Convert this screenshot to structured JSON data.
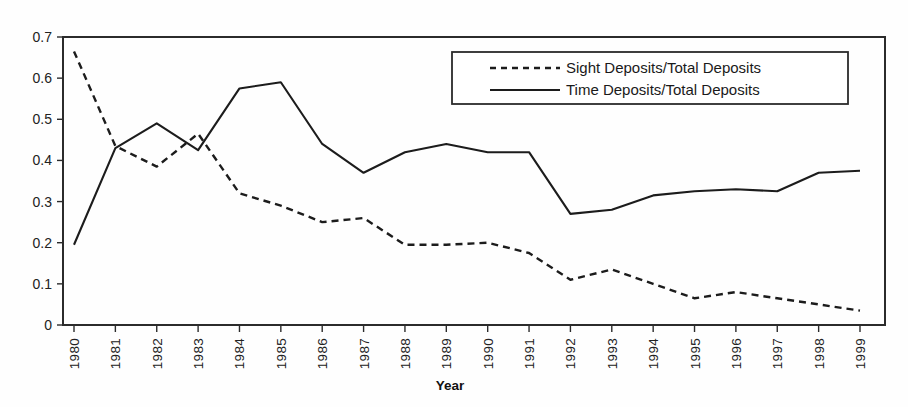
{
  "chart_data": {
    "type": "line",
    "title": "",
    "xlabel": "Year",
    "ylabel": "",
    "categories": [
      "1980",
      "1981",
      "1982",
      "1983",
      "1984",
      "1985",
      "1986",
      "1987",
      "1988",
      "1989",
      "1990",
      "1991",
      "1992",
      "1993",
      "1994",
      "1995",
      "1996",
      "1997",
      "1998",
      "1999"
    ],
    "series": [
      {
        "name": "Sight Deposits/Total Deposits",
        "style": "dashed",
        "values": [
          0.665,
          0.435,
          0.385,
          0.465,
          0.32,
          0.29,
          0.25,
          0.26,
          0.195,
          0.195,
          0.2,
          0.175,
          0.11,
          0.135,
          0.1,
          0.065,
          0.08,
          0.065,
          0.05,
          0.035
        ]
      },
      {
        "name": "Time Deposits/Total Deposits",
        "style": "solid",
        "values": [
          0.195,
          0.43,
          0.49,
          0.425,
          0.575,
          0.59,
          0.44,
          0.37,
          0.42,
          0.44,
          0.42,
          0.42,
          0.27,
          0.28,
          0.315,
          0.325,
          0.33,
          0.325,
          0.37,
          0.375
        ]
      }
    ],
    "ylim": [
      0,
      0.7
    ],
    "yticks": [
      0,
      0.1,
      0.2,
      0.3,
      0.4,
      0.5,
      0.6,
      0.7
    ],
    "ytick_labels": [
      "0",
      "0.1",
      "0.2",
      "0.3",
      "0.4",
      "0.5",
      "0.6",
      "0.7"
    ],
    "grid": false,
    "legend_position": "top-right",
    "line_color": "#1c1c1c",
    "frame_color": "#2b2b2b"
  },
  "legend": {
    "entries": [
      {
        "label": "Sight Deposits/Total Deposits",
        "style": "dashed"
      },
      {
        "label": "Time Deposits/Total Deposits",
        "style": "solid"
      }
    ]
  },
  "axis": {
    "x_title": "Year"
  }
}
